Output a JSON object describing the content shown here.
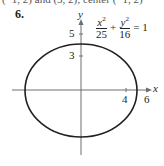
{
  "clipped_text": "(−1, 2) and (3, 2); center (−1, 2)",
  "problem_number": "6.",
  "equation": {
    "term1": {
      "numerator": "x",
      "exponent": "2",
      "denominator": "25"
    },
    "plus": "+",
    "term2": {
      "numerator": "y",
      "exponent": "2",
      "denominator": "16"
    },
    "equals": "= 1"
  },
  "axes": {
    "x_label": "x",
    "y_label": "y",
    "x_ticks": [
      "4",
      "6"
    ],
    "y_ticks": [
      "5",
      "3"
    ]
  },
  "colors": {
    "ink": "#231f20",
    "axis": "#6d6e70"
  }
}
